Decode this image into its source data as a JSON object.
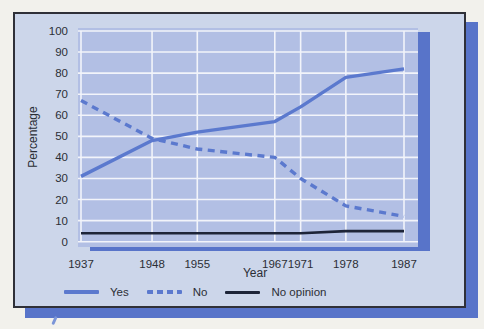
{
  "colors": {
    "page_bg": "#f2f1ec",
    "card_bg": "#ccd6ea",
    "plot_bg": "#b2bfe4",
    "grid": "#f2f4fa",
    "shadow": "#5874c9",
    "blue_line": "#5b79ce",
    "dark_line": "#1d2438",
    "text": "#2b2e35"
  },
  "legend": [
    {
      "label": "Yes",
      "style": "solid",
      "color": "#5b79ce"
    },
    {
      "label": "No",
      "style": "dashed",
      "color": "#5b79ce"
    },
    {
      "label": "No opinion",
      "style": "solid-dark",
      "color": "#1d2438"
    }
  ],
  "chart_data": {
    "type": "line",
    "title": "",
    "xlabel": "Year",
    "ylabel": "Percentage",
    "x": [
      1937,
      1948,
      1955,
      1967,
      1971,
      1978,
      1987
    ],
    "x_tick_labels": [
      "1937",
      "1948",
      "1955",
      "1967",
      "1971",
      "1978",
      "1987"
    ],
    "y_ticks": [
      0,
      10,
      20,
      30,
      40,
      50,
      60,
      70,
      80,
      90,
      100
    ],
    "ylim": [
      0,
      100
    ],
    "grid": true,
    "legend_position": "bottom",
    "series": [
      {
        "name": "Yes",
        "line": "solid",
        "color": "#5b79ce",
        "values": [
          31,
          48,
          52,
          57,
          64,
          78,
          82
        ]
      },
      {
        "name": "No",
        "line": "dashed",
        "color": "#5b79ce",
        "values": [
          67,
          49,
          44,
          40,
          30,
          17,
          12
        ]
      },
      {
        "name": "No opinion",
        "line": "solid",
        "color": "#1d2438",
        "values": [
          4,
          4,
          4,
          4,
          4,
          5,
          5
        ]
      }
    ]
  }
}
